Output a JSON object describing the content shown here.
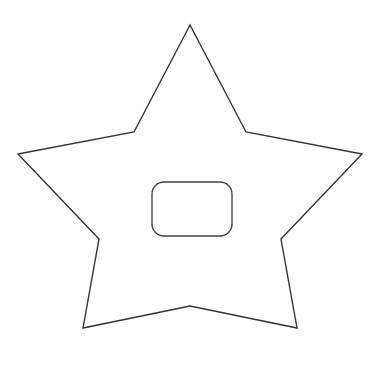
{
  "diagram": {
    "background": "#ffffff",
    "stroke": "#333333",
    "star": {
      "points": "190,25 134,132 18,154 99,239 83,328 190,306 297,328 281,239 362,154 246,132",
      "fill": "#ffffff"
    },
    "inner_box": {
      "x": 152,
      "y": 182,
      "width": 80,
      "height": 54,
      "rx": 12,
      "fill": "#ffffff",
      "label": ""
    }
  }
}
